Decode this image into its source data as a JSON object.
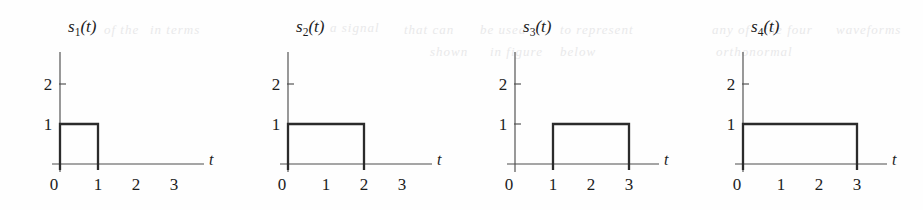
{
  "figure": {
    "background_color": "#fefefe",
    "axis_color": "#4d4d4d",
    "pulse_color": "#2b2b2b",
    "text_color": "#1c1c1c",
    "ghost_artifact_color": "#e9e9ea",
    "ghost_artifacts": [
      {
        "text": "of the",
        "x": 104,
        "y": 22
      },
      {
        "text": "in terms",
        "x": 150,
        "y": 22
      },
      {
        "text": "a signal",
        "x": 330,
        "y": 20
      },
      {
        "text": "that can",
        "x": 404,
        "y": 22
      },
      {
        "text": "be used",
        "x": 480,
        "y": 22
      },
      {
        "text": "to represent",
        "x": 560,
        "y": 22
      },
      {
        "text": "any of",
        "x": 712,
        "y": 22
      },
      {
        "text": "the four",
        "x": 764,
        "y": 22
      },
      {
        "text": "waveforms",
        "x": 836,
        "y": 22
      },
      {
        "text": "shown",
        "x": 430,
        "y": 44
      },
      {
        "text": "in figure",
        "x": 490,
        "y": 44
      },
      {
        "text": "below",
        "x": 560,
        "y": 44
      },
      {
        "text": "orthonormal",
        "x": 716,
        "y": 44
      }
    ]
  },
  "chart_data": {
    "type": "line",
    "title": "",
    "xlabel": "t",
    "ylabel": "",
    "xlim": [
      0,
      3.6
    ],
    "ylim": [
      0,
      2.4
    ],
    "grid": false,
    "legend": "none",
    "x_ticks": [
      0,
      1,
      2,
      3
    ],
    "x_tick_labels": [
      "0",
      "1",
      "2",
      "3"
    ],
    "y_ticks": [
      1,
      2
    ],
    "y_tick_labels": [
      "1",
      "2"
    ],
    "panels": [
      {
        "id": "s1",
        "label_base": "s",
        "label_subscript": "1",
        "label_arg": "(t)",
        "label_full": "s1(t)",
        "axis_label_x": "t",
        "pulse_start": 0,
        "pulse_end": 1,
        "amplitude": 1,
        "x_ticks": [
          0,
          1,
          2,
          3
        ],
        "x_tick_labels": [
          "0",
          "1",
          "2",
          "3"
        ],
        "y_ticks": [
          1,
          2
        ],
        "y_tick_labels": [
          "1",
          "2"
        ]
      },
      {
        "id": "s2",
        "label_base": "s",
        "label_subscript": "2",
        "label_arg": "(t)",
        "label_full": "s2(t)",
        "axis_label_x": "t",
        "pulse_start": 0,
        "pulse_end": 2,
        "amplitude": 1,
        "x_ticks": [
          0,
          1,
          2,
          3
        ],
        "x_tick_labels": [
          "0",
          "1",
          "2",
          "3"
        ],
        "y_ticks": [
          1,
          2
        ],
        "y_tick_labels": [
          "1",
          "2"
        ]
      },
      {
        "id": "s3",
        "label_base": "s",
        "label_subscript": "3",
        "label_arg": "(t)",
        "label_full": "s3(t)",
        "axis_label_x": "t",
        "pulse_start": 1,
        "pulse_end": 3,
        "amplitude": 1,
        "x_ticks": [
          0,
          1,
          2,
          3
        ],
        "x_tick_labels": [
          "0",
          "1",
          "2",
          "3"
        ],
        "y_ticks": [
          1,
          2
        ],
        "y_tick_labels": [
          "1",
          "2"
        ]
      },
      {
        "id": "s4",
        "label_base": "s",
        "label_subscript": "4",
        "label_arg": "(t)",
        "label_full": "s4(t)",
        "axis_label_x": "t",
        "pulse_start": 0,
        "pulse_end": 3,
        "amplitude": 1,
        "x_ticks": [
          0,
          1,
          2,
          3
        ],
        "x_tick_labels": [
          "0",
          "1",
          "2",
          "3"
        ],
        "y_ticks": [
          1,
          2
        ],
        "y_tick_labels": [
          "1",
          "2"
        ]
      }
    ]
  },
  "geometry": {
    "panel_offsets": [
      0,
      228,
      455,
      683
    ],
    "panel_width": 230,
    "panel_height": 210,
    "origin_x": 60,
    "baseline_y": 164,
    "unit_x": 38,
    "unit_y": 40,
    "y_axis_top": 52,
    "x_axis_right": 204,
    "edge_overshoot": 6,
    "tick_len": 6
  }
}
